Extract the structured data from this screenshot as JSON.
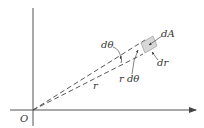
{
  "figure": {
    "origin_label": "O",
    "labels": {
      "dtheta": "dθ",
      "dA": "dA",
      "dr": "dr",
      "r_dtheta": "r dθ",
      "r": "r"
    },
    "colors": {
      "axis": "#555555",
      "dashed": "#444444",
      "element_fill": "#d8d8d8",
      "element_stroke": "#9a9a9a",
      "text": "#333333"
    }
  }
}
